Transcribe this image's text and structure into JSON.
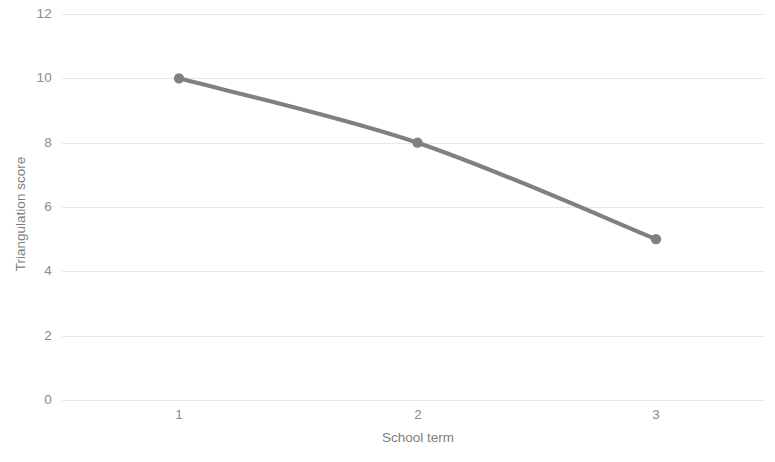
{
  "chart_data": {
    "type": "line",
    "title": "",
    "xlabel": "School term",
    "ylabel": "Triangulation score",
    "x": [
      1,
      2,
      3
    ],
    "categories": [
      "1",
      "2",
      "3"
    ],
    "series": [
      {
        "name": "Triangulation score",
        "values": [
          10,
          8,
          5
        ],
        "color": "#808080",
        "marker": "circle",
        "smooth": true
      }
    ],
    "xlim": [
      0.5,
      3.5
    ],
    "ylim": [
      0,
      12
    ],
    "x_ticks": [
      "1",
      "2",
      "3"
    ],
    "y_ticks": [
      "0",
      "2",
      "4",
      "6",
      "8",
      "10",
      "12"
    ],
    "y_tick_values": [
      0,
      2,
      4,
      6,
      8,
      10,
      12
    ],
    "grid": "horizontal",
    "grid_color": "#e9e9e9",
    "legend": "none",
    "background": "#ffffff",
    "axis_text_color": "#8a8a8a"
  }
}
